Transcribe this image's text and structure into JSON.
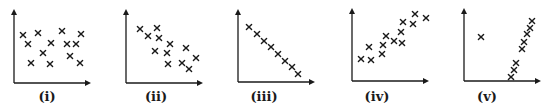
{
  "figure": {
    "background": "#ffffff",
    "ink_color": "#1a1a1a"
  },
  "chart_data": [
    {
      "type": "scatter",
      "label": "(i)",
      "title": "",
      "xlabel": "",
      "ylabel": "",
      "grid": false,
      "marker": "x",
      "description": "no correlation",
      "axes": {
        "origin": [
          14,
          83
        ],
        "x_end": 91,
        "y_end": 9
      },
      "points": [
        [
          23,
          35
        ],
        [
          38,
          33
        ],
        [
          62,
          31
        ],
        [
          81,
          34
        ],
        [
          28,
          44
        ],
        [
          51,
          43
        ],
        [
          67,
          44
        ],
        [
          76,
          44
        ],
        [
          43,
          53
        ],
        [
          70,
          56
        ],
        [
          31,
          63
        ],
        [
          50,
          64
        ],
        [
          80,
          63
        ]
      ]
    },
    {
      "type": "scatter",
      "label": "(ii)",
      "title": "",
      "xlabel": "",
      "ylabel": "",
      "grid": false,
      "marker": "x",
      "description": "weak negative correlation",
      "axes": {
        "origin": [
          126,
          83
        ],
        "x_end": 203,
        "y_end": 9
      },
      "points": [
        [
          140,
          29
        ],
        [
          157,
          28
        ],
        [
          148,
          36
        ],
        [
          159,
          38
        ],
        [
          170,
          44
        ],
        [
          186,
          48
        ],
        [
          155,
          51
        ],
        [
          167,
          53
        ],
        [
          196,
          58
        ],
        [
          168,
          64
        ],
        [
          182,
          63
        ],
        [
          189,
          69
        ]
      ]
    },
    {
      "type": "scatter",
      "label": "(iii)",
      "title": "",
      "xlabel": "",
      "ylabel": "",
      "grid": false,
      "marker": "x",
      "description": "perfect negative linear correlation",
      "axes": {
        "origin": [
          238,
          82
        ],
        "x_end": 315,
        "y_end": 9
      },
      "points": [
        [
          249,
          27
        ],
        [
          257,
          34
        ],
        [
          264,
          41
        ],
        [
          271,
          47
        ],
        [
          278,
          54
        ],
        [
          285,
          61
        ],
        [
          292,
          67
        ],
        [
          298,
          74
        ]
      ]
    },
    {
      "type": "scatter",
      "label": "(iv)",
      "title": "",
      "xlabel": "",
      "ylabel": "",
      "grid": false,
      "marker": "x",
      "description": "positive correlation",
      "axes": {
        "origin": [
          352,
          81
        ],
        "x_end": 429,
        "y_end": 8
      },
      "points": [
        [
          415,
          14
        ],
        [
          426,
          18
        ],
        [
          403,
          22
        ],
        [
          413,
          24
        ],
        [
          401,
          32
        ],
        [
          386,
          36
        ],
        [
          394,
          41
        ],
        [
          402,
          43
        ],
        [
          383,
          45
        ],
        [
          369,
          47
        ],
        [
          382,
          54
        ],
        [
          361,
          59
        ],
        [
          371,
          60
        ]
      ]
    },
    {
      "type": "scatter",
      "label": "(v)",
      "title": "",
      "xlabel": "",
      "ylabel": "",
      "grid": false,
      "marker": "x",
      "description": "strong positive correlation with one outlier",
      "axes": {
        "origin": [
          464,
          81
        ],
        "x_end": 541,
        "y_end": 8
      },
      "points": [
        [
          481,
          37
        ],
        [
          532,
          21
        ],
        [
          530,
          28
        ],
        [
          527,
          34
        ],
        [
          524,
          42
        ],
        [
          522,
          49
        ],
        [
          516,
          63
        ],
        [
          514,
          70
        ],
        [
          511,
          77
        ]
      ]
    }
  ],
  "labels": [
    "(i)",
    "(ii)",
    "(iii)",
    "(iv)",
    "(v)"
  ],
  "label_x": [
    47,
    156,
    264,
    377,
    487
  ]
}
